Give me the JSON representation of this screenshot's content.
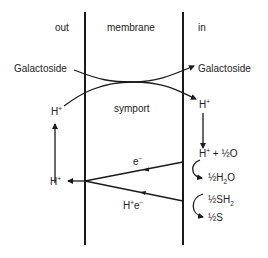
{
  "diagram": {
    "regions": {
      "out": "out",
      "membrane": "membrane",
      "in": "in"
    },
    "transport": {
      "substrate_out": "Galactoside",
      "substrate_in": "Galactoside",
      "mechanism": "symport",
      "proton_out": "H",
      "proton_in": "H",
      "charge_plus": "+"
    },
    "electron_transport": {
      "proton_released": "H",
      "electron_label": "e",
      "electron_charge": "−",
      "proton_electron_label_h": "H",
      "proton_electron_label_e": "e",
      "plus": "+"
    },
    "reactions": {
      "oxygen_reaction": {
        "reactant_h": "H",
        "reactant_plus": "+",
        "reactant_plus_sign": " + ",
        "reactant_half": "½",
        "reactant_o": "O",
        "product_half": "½",
        "product_h": "H",
        "product_sub": "2",
        "product_o": "O"
      },
      "sulfide_reaction": {
        "reactant_half": "½",
        "reactant_sh": "SH",
        "reactant_sub": "2",
        "product_half": "½",
        "product_s": "S"
      }
    },
    "colors": {
      "line": "#1a1a1a",
      "text": "#222222",
      "background": "#ffffff"
    }
  }
}
